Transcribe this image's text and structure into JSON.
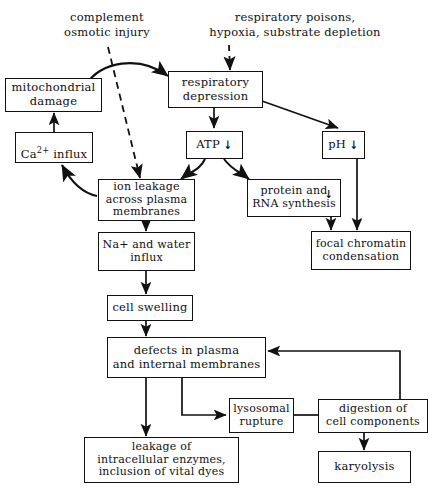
{
  "diagram": {
    "line_color": "#111111",
    "background": "#ffffff",
    "down_arrow_glyph": "↓",
    "free_labels": {
      "complement": "complement\nosmotic injury",
      "respiratory": "respiratory poisons,\nhypoxia, substrate depletion"
    },
    "nodes": {
      "mitochondrial_damage": "mitochondrial\ndamage",
      "respiratory_depression": "respiratory\ndepression",
      "ca_influx_pre": "Ca",
      "ca_influx_sup": "2+",
      "ca_influx_post": "influx",
      "atp": "ATP",
      "ph": "pH",
      "ion_leakage": "ion leakage\nacross plasma\nmembranes",
      "protein_rna": "protein and\nRNA synthesis",
      "na_water_influx": "Na+ and water\ninflux",
      "focal_chromatin": "focal chromatin\ncondensation",
      "cell_swelling": "cell swelling",
      "defects_membranes": "defects in plasma\nand internal membranes",
      "lysosomal_rupture": "lysosomal\nrupture",
      "digestion": "digestion of\ncell components",
      "leakage_enzymes": "leakage of\nintracellular enzymes,\ninclusion of vital dyes",
      "karyolysis": "karyolysis"
    }
  }
}
